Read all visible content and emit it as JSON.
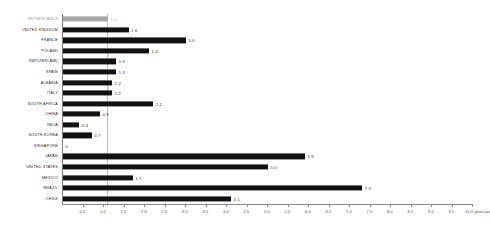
{
  "chart_data": {
    "type": "bar",
    "orientation": "horizontal",
    "title": "",
    "xlabel": "gha/cap",
    "ylabel": "",
    "xlim": [
      0,
      10.0
    ],
    "xtick_step": 0.5,
    "grid": false,
    "legend": "none",
    "unit_label": "10.0 gha/cap",
    "reference_line_value": 1.1,
    "highlight_category": "NETHERLANDS",
    "colors": {
      "bar": "#111111",
      "highlight_bar": "#a8a8a8",
      "axis": "#8a8a8a",
      "reference_line": "#bdbdbd",
      "label": "#1a1a1a",
      "highlight_label": "#9a9a9a"
    },
    "categories": [
      "NETHERLANDS",
      "UNITED KINGDOM",
      "FRANCE",
      "POLAND",
      "SWITZERLAND",
      "SPAIN",
      "ALBANIA",
      "ITALY",
      "SOUTH AFRICA",
      "CHINA",
      "INDIA",
      "SOUTH KOREA",
      "SINGAPORE",
      "JAPAN",
      "UNITED STATES",
      "MEXICO",
      "BRAZIL",
      "CHILE"
    ],
    "values": [
      1.1,
      1.6,
      3.0,
      2.1,
      1.3,
      1.3,
      1.2,
      1.2,
      2.2,
      0.9,
      0.4,
      0.7,
      0.0,
      5.9,
      5.0,
      1.7,
      7.3,
      4.1
    ],
    "labels": [
      "1.1",
      "1.6",
      "3.0",
      "1.4",
      "1.3",
      "1.3",
      "1.2",
      "1.2",
      "2.2",
      "0.9",
      "0.4",
      "0.7",
      "0",
      "5.9",
      "5.0",
      "1.7",
      "7.3",
      "4.1"
    ],
    "xticks": [
      {
        "value": 0.5,
        "label": "0.5"
      },
      {
        "value": 1.0,
        "label": "1.0"
      },
      {
        "value": 1.5,
        "label": "1.5"
      },
      {
        "value": 2.0,
        "label": "2.0"
      },
      {
        "value": 2.5,
        "label": "2.5"
      },
      {
        "value": 3.0,
        "label": "3.0"
      },
      {
        "value": 3.5,
        "label": "3.5"
      },
      {
        "value": 4.0,
        "label": "4.0"
      },
      {
        "value": 4.5,
        "label": "4.5"
      },
      {
        "value": 5.0,
        "label": "5.0"
      },
      {
        "value": 5.5,
        "label": "5.5"
      },
      {
        "value": 6.0,
        "label": "6.0"
      },
      {
        "value": 6.5,
        "label": "6.5"
      },
      {
        "value": 7.0,
        "label": "7.0"
      },
      {
        "value": 7.5,
        "label": "7.5"
      },
      {
        "value": 8.0,
        "label": "8.0"
      },
      {
        "value": 8.5,
        "label": "8.5"
      },
      {
        "value": 9.0,
        "label": "9.0"
      },
      {
        "value": 9.5,
        "label": "9.5"
      },
      {
        "value": 10.0,
        "label": "10.0 gha/cap"
      }
    ]
  }
}
